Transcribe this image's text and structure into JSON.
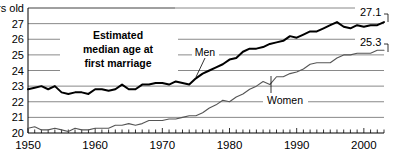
{
  "chart_data": {
    "type": "line",
    "title_line1": "Estimated",
    "title_line2": "median age at",
    "title_line3": "first marriage",
    "xlabel": "",
    "ylabel": "",
    "y_unit_label": "years old",
    "ylim": [
      20,
      28
    ],
    "xlim": [
      1950,
      2003
    ],
    "grid": true,
    "legend_position": "inline-annotations",
    "yticks": [
      20,
      21,
      22,
      23,
      24,
      25,
      26,
      27,
      28
    ],
    "ytick_labels": [
      "20",
      "21",
      "22",
      "23",
      "24",
      "25",
      "26",
      "27",
      "28 years old"
    ],
    "xticks": [
      1950,
      1960,
      1970,
      1980,
      1990,
      2000
    ],
    "xtick_labels": [
      "1950",
      "1960",
      "1970",
      "1980",
      "1990",
      "2000"
    ],
    "x_minor_tick_interval": 1,
    "annotations": [
      {
        "name": "men-label",
        "text": "Men",
        "year": 1977,
        "value": 25.0
      },
      {
        "name": "women-label",
        "text": "Women",
        "year": 1990,
        "value": 22.6
      },
      {
        "name": "men-end-value",
        "text": "27.1",
        "year": 2003,
        "value": 27.1
      },
      {
        "name": "women-end-value",
        "text": "25.3",
        "year": 2003,
        "value": 25.3
      }
    ],
    "series": [
      {
        "name": "Men",
        "color": "#000000",
        "end_label": "27.1",
        "x": [
          1950,
          1951,
          1952,
          1953,
          1954,
          1955,
          1956,
          1957,
          1958,
          1959,
          1960,
          1961,
          1962,
          1963,
          1964,
          1965,
          1966,
          1967,
          1968,
          1969,
          1970,
          1971,
          1972,
          1973,
          1974,
          1975,
          1976,
          1977,
          1978,
          1979,
          1980,
          1981,
          1982,
          1983,
          1984,
          1985,
          1986,
          1987,
          1988,
          1989,
          1990,
          1991,
          1992,
          1993,
          1994,
          1995,
          1996,
          1997,
          1998,
          1999,
          2000,
          2001,
          2002,
          2003
        ],
        "values": [
          22.8,
          22.9,
          23.0,
          22.8,
          23.0,
          22.6,
          22.5,
          22.6,
          22.6,
          22.5,
          22.8,
          22.8,
          22.7,
          22.8,
          23.1,
          22.8,
          22.8,
          23.1,
          23.1,
          23.2,
          23.2,
          23.1,
          23.3,
          23.2,
          23.1,
          23.5,
          23.8,
          24.0,
          24.2,
          24.4,
          24.7,
          24.8,
          25.2,
          25.4,
          25.4,
          25.5,
          25.7,
          25.8,
          25.9,
          26.2,
          26.1,
          26.3,
          26.5,
          26.5,
          26.7,
          26.9,
          27.1,
          26.8,
          26.7,
          26.9,
          26.8,
          26.9,
          26.9,
          27.1
        ]
      },
      {
        "name": "Women",
        "color": "#555555",
        "end_label": "25.3",
        "x": [
          1950,
          1951,
          1952,
          1953,
          1954,
          1955,
          1956,
          1957,
          1958,
          1959,
          1960,
          1961,
          1962,
          1963,
          1964,
          1965,
          1966,
          1967,
          1968,
          1969,
          1970,
          1971,
          1972,
          1973,
          1974,
          1975,
          1976,
          1977,
          1978,
          1979,
          1980,
          1981,
          1982,
          1983,
          1984,
          1985,
          1986,
          1987,
          1988,
          1989,
          1990,
          1991,
          1992,
          1993,
          1994,
          1995,
          1996,
          1997,
          1998,
          1999,
          2000,
          2001,
          2002,
          2003
        ],
        "values": [
          20.3,
          20.4,
          20.2,
          20.2,
          20.3,
          20.2,
          20.1,
          20.3,
          20.2,
          20.2,
          20.3,
          20.3,
          20.3,
          20.5,
          20.5,
          20.6,
          20.5,
          20.6,
          20.8,
          20.8,
          20.8,
          20.9,
          20.9,
          21.0,
          21.1,
          21.1,
          21.3,
          21.6,
          21.8,
          22.1,
          22.0,
          22.3,
          22.5,
          22.8,
          23.0,
          23.3,
          23.1,
          23.6,
          23.6,
          23.8,
          23.9,
          24.1,
          24.4,
          24.5,
          24.5,
          24.5,
          24.8,
          25.0,
          25.0,
          25.1,
          25.1,
          25.1,
          25.3,
          25.3
        ]
      }
    ]
  }
}
